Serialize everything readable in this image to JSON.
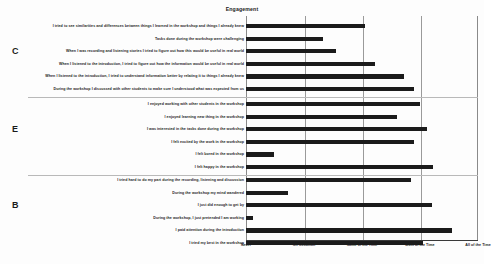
{
  "chart": {
    "title": "Engagement",
    "axis": {
      "ticks": [
        "Never",
        "On Occasion",
        "Some of the Time",
        "Most of the Time",
        "All of the Time"
      ]
    },
    "sections": [
      {
        "letter": "C"
      },
      {
        "letter": "E"
      },
      {
        "letter": "B"
      }
    ]
  },
  "chart_data": {
    "type": "bar",
    "orientation": "horizontal",
    "title": "Engagement",
    "xlabel": "",
    "ylabel": "",
    "xlim": [
      0,
      4
    ],
    "grid": true,
    "legend": false,
    "xtick_labels": [
      "Never",
      "On Occasion",
      "Some of the Time",
      "Most of the Time",
      "All of the Time"
    ],
    "xtick_values": [
      0,
      1,
      2,
      3,
      4
    ],
    "groups": [
      {
        "letter": "C",
        "categories": [
          "I tried to see similarities and differences between things I learned in the workshop and things I already knew",
          "Tasks done during the workshop were challenging",
          "When I was recording and listening stories I tried to figure out how this would be useful in real world",
          "When I listened to the introduction, I tried to figure out how the information would be useful in real world",
          "When I listened to the introduction, I tried to understand information better by relating it to things I already knew",
          "During the workshop I discussed with other students to make sure I understood what was expected from us"
        ],
        "values": [
          2.06,
          1.33,
          1.55,
          2.22,
          2.72,
          2.9
        ]
      },
      {
        "letter": "E",
        "categories": [
          "I enjoyed working with other students in the workshop",
          "I enjoyed learning new thing in the workshop",
          "I was interested in the tasks done during the workshop",
          "I felt excited by the work in the workshop",
          "I felt bored in the workshop",
          "I felt happy in the workshop"
        ],
        "values": [
          3.0,
          2.6,
          3.12,
          2.9,
          0.48,
          3.22
        ]
      },
      {
        "letter": "B",
        "categories": [
          "I tried hard to do my part during the recording, listening and discussion",
          "During the workshop my mind wandered",
          "I just did enough to get by",
          "During the workshop, I just pretended I am working",
          "I paid attention during the introduction",
          "I tried my best in the workshop"
        ],
        "values": [
          2.84,
          0.72,
          3.2,
          0.12,
          3.55,
          3.05
        ]
      }
    ]
  }
}
